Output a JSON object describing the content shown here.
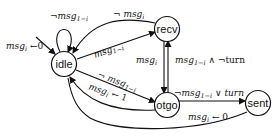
{
  "diagram": {
    "type": "state-machine",
    "nodes": [
      {
        "id": "idle",
        "label": "idle"
      },
      {
        "id": "recv",
        "label": "recv"
      },
      {
        "id": "otgo",
        "label": "otgo"
      },
      {
        "id": "sent",
        "label": "sent"
      }
    ],
    "edges": [
      {
        "from": "init",
        "to": "idle",
        "label": "msgᵢ ← 0",
        "label_main": "msg",
        "label_sub": "i",
        "label_rest": " ←0"
      },
      {
        "from": "idle",
        "to": "idle",
        "label": "¬msg₁₋ᵢ",
        "label_main": "¬msg",
        "label_sub": "1−i"
      },
      {
        "from": "recv",
        "to": "idle",
        "label": "¬ msgᵢ",
        "label_main": "¬ msg",
        "label_sub": "i"
      },
      {
        "from": "idle",
        "to": "recv",
        "label": "msg₁₋ᵢ",
        "label_main": "msg",
        "label_sub": "1−i"
      },
      {
        "from": "idle",
        "to": "otgo",
        "label": "¬ msg₁₋ᵢ",
        "label_main": "¬ msg",
        "label_sub": "1−i"
      },
      {
        "from": "otgo",
        "to": "idle",
        "label": "msgᵢ ← 1",
        "label_main": "msg",
        "label_sub": "i",
        "label_rest": " ← 1"
      },
      {
        "from": "recv",
        "to": "otgo",
        "label": "msgᵢ",
        "label_main": "msg",
        "label_sub": "i"
      },
      {
        "from": "otgo",
        "to": "recv",
        "label": "msg₁₋ᵢ ∧ ¬turn",
        "label_main": "msg",
        "label_sub": "1−i",
        "label_rest": " ∧ ¬turn"
      },
      {
        "from": "otgo",
        "to": "sent",
        "label": "¬msg₁₋ᵢ ∨ turn",
        "label_main": "¬msg",
        "label_sub": "1−i",
        "label_rest": " ∨ turn"
      },
      {
        "from": "sent",
        "to": "idle",
        "label": "msgᵢ ← 0",
        "label_main": "msg",
        "label_sub": "i",
        "label_rest": " ← 0"
      }
    ]
  }
}
